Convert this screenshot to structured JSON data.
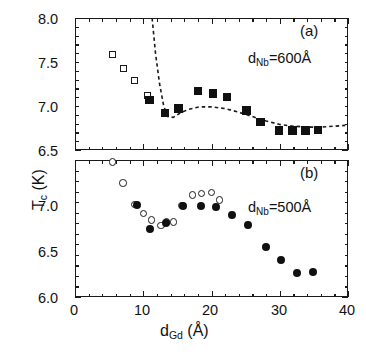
{
  "figure": {
    "ylabel": "T",
    "ylabel_sub": "c",
    "ylabel_unit": " (K)",
    "xlabel": "d",
    "xlabel_sub": "Gd",
    "xlabel_unit": "  (Å)"
  },
  "panel_a": {
    "tag": "(a)",
    "annotation_prefix": "d",
    "annotation_sub": "Nb",
    "annotation_suffix": "=600Å",
    "ytick_labels": [
      "8.0",
      "7.5",
      "7.0",
      "6.5"
    ]
  },
  "panel_b": {
    "tag": "(b)",
    "annotation_prefix": "d",
    "annotation_sub": "Nb",
    "annotation_suffix": "=500Å",
    "ytick_labels": [
      "7.0",
      "6.5",
      "6.0"
    ]
  },
  "xtick_labels": [
    "0",
    "10",
    "20",
    "30",
    "40"
  ],
  "colors": {
    "axis": "#1a1a1a",
    "marker_fill": "#101010",
    "marker_open": "#ffffff",
    "background": "#ffffff"
  },
  "chart_data": [
    {
      "type": "scatter",
      "panel": "(a)",
      "title": "",
      "xlabel": "d_Gd (Å)",
      "ylabel": "T_c (K)",
      "xlim": [
        0,
        40
      ],
      "ylim": [
        6.5,
        8.0
      ],
      "yticks": [
        6.5,
        7.0,
        7.5,
        8.0
      ],
      "xticks": [
        0,
        10,
        20,
        30,
        40
      ],
      "grid": false,
      "legend": false,
      "annotation": "d_Nb=600Å",
      "series": [
        {
          "name": "open squares",
          "marker": "square-open",
          "x": [
            5.6,
            7.2,
            8.8,
            10.6
          ],
          "y": [
            7.58,
            7.42,
            7.29,
            7.12
          ]
        },
        {
          "name": "filled squares",
          "marker": "square-filled",
          "x": [
            10.9,
            13.2,
            15.2,
            18.0,
            20.2,
            22.3,
            25.1,
            27.2,
            29.9,
            31.9,
            33.8,
            35.6
          ],
          "y": [
            7.07,
            6.92,
            6.97,
            7.17,
            7.14,
            7.1,
            6.95,
            6.82,
            6.72,
            6.72,
            6.72,
            6.73
          ]
        }
      ],
      "fit_curve": {
        "name": "dashed guide",
        "style": "dashed",
        "x": [
          11.3,
          11.8,
          12.4,
          13.0,
          13.6,
          14.4,
          15.4,
          16.6,
          18.2,
          20.0,
          22.0,
          24.0,
          26.0,
          28.0,
          30.0,
          32.0,
          34.0,
          36.0,
          38.0,
          39.6
        ],
        "y": [
          8.0,
          7.6,
          7.25,
          7.0,
          6.88,
          6.87,
          6.92,
          6.96,
          6.99,
          6.99,
          6.97,
          6.93,
          6.88,
          6.83,
          6.79,
          6.77,
          6.76,
          6.76,
          6.77,
          6.78
        ]
      }
    },
    {
      "type": "scatter",
      "panel": "(b)",
      "title": "",
      "xlabel": "d_Gd (Å)",
      "ylabel": "T_c (K)",
      "xlim": [
        0,
        40
      ],
      "ylim": [
        6.0,
        7.3
      ],
      "yticks": [
        6.0,
        6.5,
        7.0
      ],
      "xticks": [
        0,
        10,
        20,
        30,
        40
      ],
      "grid": false,
      "legend": false,
      "annotation": "d_Nb=500Å",
      "series": [
        {
          "name": "open circles",
          "marker": "circle-open",
          "x": [
            5.5,
            7.0,
            8.8,
            10.0,
            11.2,
            12.6,
            13.4,
            14.4,
            15.7,
            17.2,
            18.5,
            20.0,
            21.2
          ],
          "y": [
            7.28,
            7.08,
            6.88,
            6.79,
            6.73,
            6.68,
            6.71,
            6.71,
            6.87,
            6.97,
            6.98,
            6.99,
            6.92
          ]
        },
        {
          "name": "filled circles",
          "marker": "circle-filled",
          "x": [
            9.1,
            11.0,
            13.3,
            15.8,
            18.4,
            20.6,
            23.0,
            25.4,
            28.0,
            30.2,
            32.6,
            34.9
          ],
          "y": [
            6.87,
            6.65,
            6.7,
            6.86,
            6.86,
            6.85,
            6.78,
            6.68,
            6.47,
            6.35,
            6.23,
            6.24
          ]
        }
      ]
    }
  ]
}
